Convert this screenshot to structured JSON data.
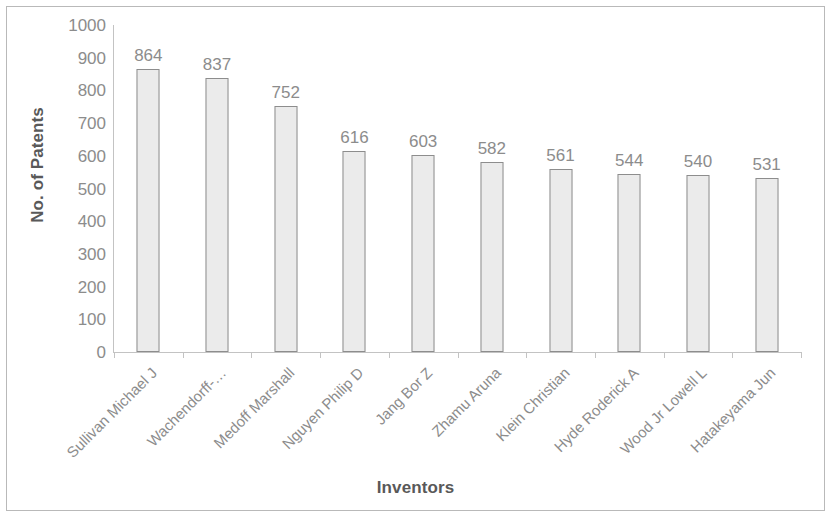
{
  "chart_data": {
    "type": "bar",
    "title": "",
    "xlabel": "Inventors",
    "ylabel": "No. of Patents",
    "categories": [
      "Sullivan Michael J",
      "Wachendorff-…",
      "Medoff Marshall",
      "Nguyen Philip D",
      "Jang Bor Z",
      "Zhamu Aruna",
      "Klein Christian",
      "Hyde Roderick A",
      "Wood Jr Lowell L",
      "Hatakeyama Jun"
    ],
    "values": [
      864,
      837,
      752,
      616,
      603,
      582,
      561,
      544,
      540,
      531
    ],
    "ylim": [
      0,
      1000
    ],
    "y_tick_step": 100,
    "y_ticks": [
      "1000",
      "900",
      "800",
      "700",
      "600",
      "500",
      "400",
      "300",
      "200",
      "100",
      "0"
    ],
    "grid": false,
    "legend": false,
    "data_labels": [
      "864",
      "837",
      "752",
      "616",
      "603",
      "582",
      "561",
      "544",
      "540",
      "531"
    ],
    "colors": {
      "bar_fill": "#ebebeb",
      "bar_border": "#8d8d8d",
      "axis_line": "#c3c3c3",
      "tick_text": "#8c8c8c",
      "axis_title_text": "#595959",
      "frame_border": "#b9b9b9",
      "background": "#ffffff"
    }
  }
}
